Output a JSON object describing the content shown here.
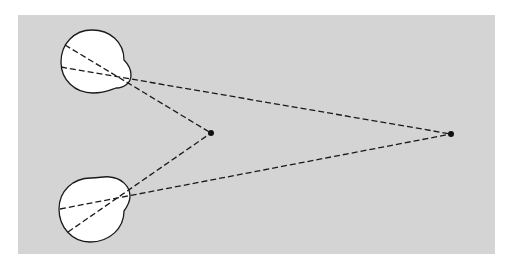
{
  "diagram": {
    "colors": {
      "background": "#ffffff",
      "panel": "#d4d4d4",
      "eye_fill": "#ffffff",
      "stroke": "#1a1a1a"
    },
    "eyes": [
      {
        "id": "top-eye",
        "cx": 92,
        "cy": 61,
        "r": 31,
        "nodal_point": [
          120,
          77
        ]
      },
      {
        "id": "bottom-eye",
        "cx": 92,
        "cy": 209,
        "r": 33,
        "nodal_point": [
          112,
          201
        ]
      }
    ],
    "fixation_points": [
      {
        "id": "near-point",
        "x": 211,
        "y": 133
      },
      {
        "id": "far-point",
        "x": 451,
        "y": 134
      }
    ]
  }
}
